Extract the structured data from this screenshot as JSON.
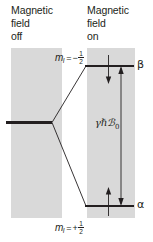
{
  "figure": {
    "background_color": "#ffffff",
    "panel_color": "#d9d9d9",
    "ink_color": "#231f20"
  },
  "panels": {
    "left": {
      "caption": "Magnetic\nfield\noff",
      "caption_lines": [
        "Magnetic",
        "field",
        "off"
      ]
    },
    "right": {
      "caption": "Magnetic\nfield\non",
      "caption_lines": [
        "Magnetic",
        "field",
        "on"
      ]
    }
  },
  "levels": {
    "degenerate": {
      "name": "degenerate-level"
    },
    "upper": {
      "state_label": "β",
      "quantum_number_var": "m",
      "quantum_number_sub": "I",
      "equals": "=",
      "sign": "−",
      "numerator": "1",
      "denominator": "2"
    },
    "lower": {
      "state_label": "α",
      "quantum_number_var": "m",
      "quantum_number_sub": "I",
      "equals": "=",
      "sign": "+",
      "numerator": "1",
      "denominator": "2"
    }
  },
  "annotations": {
    "energy_gap_label": "γℏℬ",
    "energy_gap_subscript": "0",
    "energy_gap_full": "γℏℬ₀",
    "gap_arrow": "double-headed-vertical-arrow",
    "upper_shift_arrow": "down-arrow",
    "lower_shift_arrow": "up-arrow"
  }
}
